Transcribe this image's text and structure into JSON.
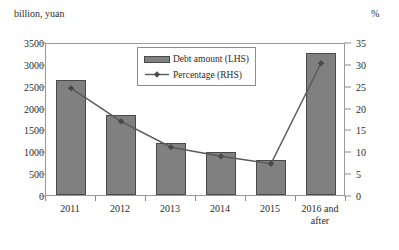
{
  "chart_data": {
    "type": "bar",
    "title": "",
    "subtitle": "",
    "xlabel": "",
    "ylabel": "billion, yuan",
    "y2label": "%",
    "categories": [
      "2011",
      "2012",
      "2013",
      "2014",
      "2015",
      "2016 and after"
    ],
    "ylim": [
      0,
      3500
    ],
    "y2lim": [
      0,
      35
    ],
    "yticks": [
      "0",
      "500",
      "1000",
      "1500",
      "2000",
      "2500",
      "3000",
      "3500"
    ],
    "y2ticks": [
      "0",
      "5",
      "10",
      "15",
      "20",
      "25",
      "30",
      "35"
    ],
    "grid": false,
    "legend_position": "top-center",
    "series": [
      {
        "name": "Debt amount (LHS)",
        "type": "bar",
        "axis": "left",
        "color": "#808080",
        "edge_color": "#4a4a4a",
        "values": [
          2630,
          1820,
          1200,
          980,
          800,
          3250
        ]
      },
      {
        "name": "Percentage (RHS)",
        "type": "line",
        "axis": "right",
        "color": "#5a5a5a",
        "marker": "diamond",
        "values": [
          24.9,
          17.3,
          11.4,
          9.3,
          7.6,
          30.6
        ]
      }
    ]
  },
  "legend": {
    "items": [
      {
        "label": "Debt amount (LHS)",
        "symbol": "filled-rect"
      },
      {
        "label": "Percentage (RHS)",
        "symbol": "line-marker"
      }
    ]
  }
}
